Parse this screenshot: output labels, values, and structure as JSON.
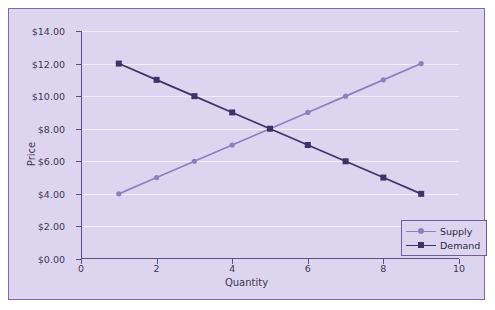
{
  "colors": {
    "panel_background": "#ddd5ef",
    "frame_border": "#7a6ba8",
    "axis": "#5d5081",
    "gridline": "#f2eefb",
    "supply": "#8b82bd",
    "demand": "#3b3466",
    "text": "#3f3557",
    "page_background": "#ffffff"
  },
  "legend": {
    "position": "bottom-right",
    "entries": [
      {
        "label": "Supply",
        "color": "#8b82bd",
        "marker": "circle"
      },
      {
        "label": "Demand",
        "color": "#3b3466",
        "marker": "square"
      }
    ]
  },
  "chart_data": {
    "type": "line",
    "title": "",
    "xlabel": "Quantity",
    "ylabel": "Price",
    "x": [
      1,
      2,
      3,
      4,
      5,
      6,
      7,
      8,
      9
    ],
    "xlim": [
      0,
      10
    ],
    "ylim": [
      0,
      14
    ],
    "xticks": [
      0,
      2,
      4,
      6,
      8,
      10
    ],
    "xtick_labels": [
      "0",
      "2",
      "4",
      "6",
      "8",
      "10"
    ],
    "xticks_minor": [
      1,
      3,
      5,
      7,
      9
    ],
    "yticks": [
      0,
      2,
      4,
      6,
      8,
      10,
      12,
      14
    ],
    "ytick_labels": [
      "$0.00",
      "$2.00",
      "$4.00",
      "$6.00",
      "$8.00",
      "$10.00",
      "$12.00",
      "$14.00"
    ],
    "grid": true,
    "legend_position": "lower right",
    "series": [
      {
        "name": "Supply",
        "color": "#8b82bd",
        "marker": "circle",
        "values": [
          4,
          5,
          6,
          7,
          8,
          9,
          10,
          11,
          12
        ]
      },
      {
        "name": "Demand",
        "color": "#3b3466",
        "marker": "square",
        "values": [
          12,
          11,
          10,
          9,
          8,
          7,
          6,
          5,
          4
        ]
      }
    ],
    "equilibrium": {
      "quantity": 5,
      "price": 8
    }
  }
}
